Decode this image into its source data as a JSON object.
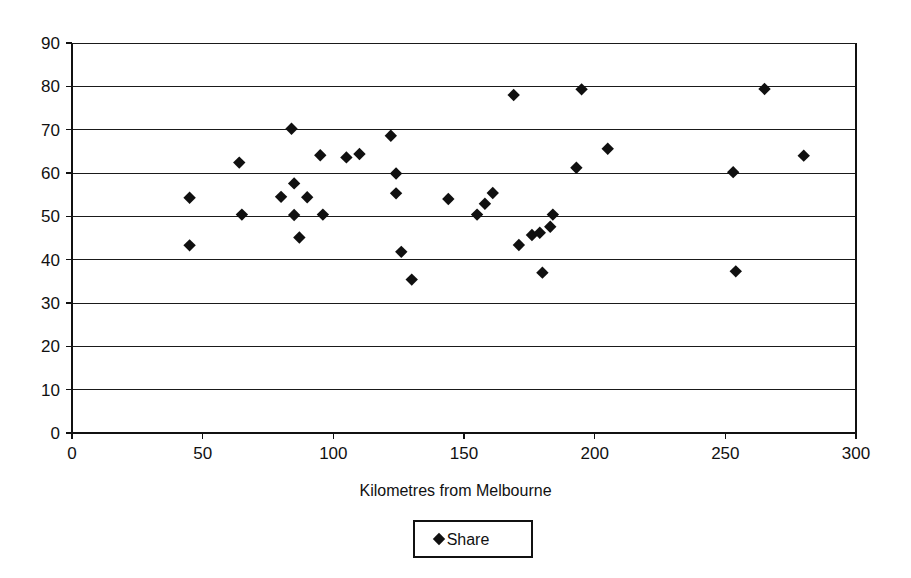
{
  "chart_data": {
    "type": "scatter",
    "title": "",
    "xlabel": "Kilometres from Melbourne",
    "ylabel": "",
    "xlim": [
      0,
      300
    ],
    "ylim": [
      0,
      90
    ],
    "xticks": [
      0,
      50,
      100,
      150,
      200,
      250,
      300
    ],
    "yticks": [
      0,
      10,
      20,
      30,
      40,
      50,
      60,
      70,
      80,
      90
    ],
    "xtick_labels": [
      "0",
      "50",
      "100",
      "150",
      "200",
      "250",
      "300"
    ],
    "ytick_labels": [
      "0",
      "10",
      "20",
      "30",
      "40",
      "50",
      "60",
      "70",
      "80",
      "90"
    ],
    "grid": "horizontal",
    "legend": {
      "position": "bottom-center",
      "entries": [
        {
          "name": "Share",
          "marker": "diamond",
          "color": "#101010"
        }
      ]
    },
    "series": [
      {
        "name": "Share",
        "marker": "diamond",
        "color": "#101010",
        "points": [
          {
            "x": 45,
            "y": 54.3
          },
          {
            "x": 45,
            "y": 43.3
          },
          {
            "x": 64,
            "y": 62.4
          },
          {
            "x": 65,
            "y": 50.4
          },
          {
            "x": 80,
            "y": 54.5
          },
          {
            "x": 84,
            "y": 70.2
          },
          {
            "x": 85,
            "y": 57.6
          },
          {
            "x": 85,
            "y": 50.3
          },
          {
            "x": 87,
            "y": 45.1
          },
          {
            "x": 90,
            "y": 54.4
          },
          {
            "x": 95,
            "y": 64.1
          },
          {
            "x": 96,
            "y": 50.4
          },
          {
            "x": 105,
            "y": 63.6
          },
          {
            "x": 110,
            "y": 64.4
          },
          {
            "x": 122,
            "y": 68.6
          },
          {
            "x": 124,
            "y": 59.9
          },
          {
            "x": 124,
            "y": 55.3
          },
          {
            "x": 126,
            "y": 41.8
          },
          {
            "x": 130,
            "y": 35.4
          },
          {
            "x": 144,
            "y": 54.0
          },
          {
            "x": 155,
            "y": 50.4
          },
          {
            "x": 158,
            "y": 52.9
          },
          {
            "x": 161,
            "y": 55.4
          },
          {
            "x": 169,
            "y": 78.0
          },
          {
            "x": 171,
            "y": 43.4
          },
          {
            "x": 176,
            "y": 45.7
          },
          {
            "x": 179,
            "y": 46.2
          },
          {
            "x": 180,
            "y": 37.0
          },
          {
            "x": 183,
            "y": 47.6
          },
          {
            "x": 184,
            "y": 50.4
          },
          {
            "x": 193,
            "y": 61.2
          },
          {
            "x": 195,
            "y": 79.3
          },
          {
            "x": 205,
            "y": 65.6
          },
          {
            "x": 253,
            "y": 60.2
          },
          {
            "x": 254,
            "y": 37.3
          },
          {
            "x": 265,
            "y": 79.4
          },
          {
            "x": 280,
            "y": 64.0
          }
        ]
      }
    ]
  },
  "axes": {
    "x_title": "Kilometres from Melbourne"
  },
  "legend": {
    "share_label": "Share"
  }
}
